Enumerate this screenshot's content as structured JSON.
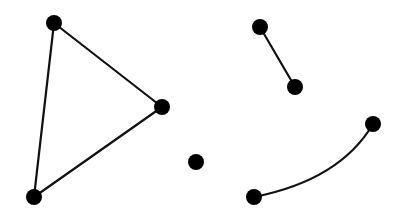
{
  "diagram": {
    "type": "graph",
    "background": "#ffffff",
    "stroke_color": "#111111",
    "node_color": "#000000",
    "node_radius": 8,
    "nodes": [
      {
        "id": "a",
        "x": 54,
        "y": 23
      },
      {
        "id": "b",
        "x": 162,
        "y": 107
      },
      {
        "id": "c",
        "x": 34,
        "y": 197
      },
      {
        "id": "d",
        "x": 196,
        "y": 162
      },
      {
        "id": "e",
        "x": 260,
        "y": 27
      },
      {
        "id": "f",
        "x": 295,
        "y": 87
      },
      {
        "id": "g",
        "x": 373,
        "y": 124
      },
      {
        "id": "h",
        "x": 254,
        "y": 197
      }
    ],
    "edges": [
      {
        "from": "a",
        "to": "b",
        "shape": "line"
      },
      {
        "from": "b",
        "to": "c",
        "shape": "line"
      },
      {
        "from": "c",
        "to": "a",
        "shape": "line"
      },
      {
        "from": "e",
        "to": "f",
        "shape": "line"
      },
      {
        "from": "h",
        "to": "g",
        "shape": "curve",
        "control": {
          "x": 340,
          "y": 180
        }
      }
    ]
  }
}
